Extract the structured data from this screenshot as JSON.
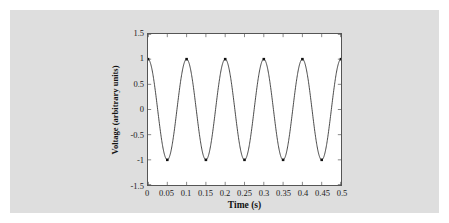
{
  "figure": {
    "background_color": "#dedede",
    "page_color": "#ffffff"
  },
  "chart_data": {
    "type": "line",
    "title": "",
    "xlabel": "Time (s)",
    "ylabel": "Voltage (arbitrary units)",
    "xlim": [
      0,
      0.5
    ],
    "ylim": [
      -1.5,
      1.5
    ],
    "grid": false,
    "legend": null,
    "line_color": "#333333",
    "marker_color": "#111111",
    "marker_style": "square",
    "xticks": [
      0,
      0.05,
      0.1,
      0.15,
      0.2,
      0.25,
      0.3,
      0.35,
      0.4,
      0.45,
      0.5
    ],
    "xticklabels": [
      "0",
      "0.05",
      "0.1",
      "0.15",
      "0.2",
      "0.25",
      "0.3",
      "0.35",
      "0.4",
      "0.45",
      "0.5"
    ],
    "yticks": [
      1.5,
      1,
      0.5,
      0,
      -0.5,
      -1,
      -1.5
    ],
    "yticklabels": [
      "1.5",
      "1",
      "0.5",
      "0",
      "-0.5",
      "-1",
      "-1.5"
    ],
    "amplitude": 1,
    "frequency_hz": 10,
    "phase": 0,
    "markers": {
      "x": [
        0,
        0.05,
        0.1,
        0.15,
        0.2,
        0.25,
        0.3,
        0.35,
        0.4,
        0.45,
        0.5
      ],
      "y": [
        1,
        -1,
        1,
        -1,
        1,
        -1,
        1,
        -1,
        1,
        -1,
        1
      ]
    },
    "series": [
      {
        "name": "Voltage",
        "x": [
          0,
          0.0125,
          0.025,
          0.0375,
          0.05,
          0.0625,
          0.075,
          0.0875,
          0.1,
          0.1125,
          0.125,
          0.1375,
          0.15,
          0.1625,
          0.175,
          0.1875,
          0.2,
          0.2125,
          0.225,
          0.2375,
          0.25,
          0.2625,
          0.275,
          0.2875,
          0.3,
          0.3125,
          0.325,
          0.3375,
          0.35,
          0.3625,
          0.375,
          0.3875,
          0.4,
          0.4125,
          0.425,
          0.4375,
          0.45,
          0.4625,
          0.475,
          0.4875,
          0.5
        ],
        "y": [
          1,
          0.707,
          0,
          -0.707,
          -1,
          -0.707,
          0,
          0.707,
          1,
          0.707,
          0,
          -0.707,
          -1,
          -0.707,
          0,
          0.707,
          1,
          0.707,
          0,
          -0.707,
          -1,
          -0.707,
          0,
          0.707,
          1,
          0.707,
          0,
          -0.707,
          -1,
          -0.707,
          0,
          0.707,
          1,
          0.707,
          0,
          -0.707,
          -1,
          -0.707,
          0,
          0.707,
          1
        ]
      }
    ]
  }
}
